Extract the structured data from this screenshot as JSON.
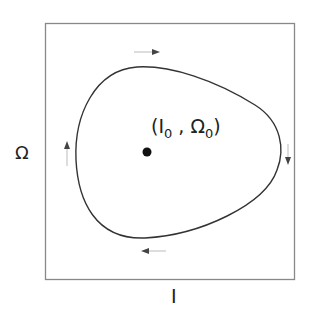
{
  "diagram": {
    "type": "phase-portrait",
    "x_axis_label": "I",
    "y_axis_label": "Ω",
    "fixed_point": {
      "label_open": "(",
      "var1": "I",
      "sub1": "0",
      "sep": " , ",
      "var2": "Ω",
      "sub2": "0",
      "label_close": ")"
    },
    "orbit_direction": "clockwise",
    "arrows": [
      "right (top)",
      "down (right)",
      "left (bottom)",
      "up (left)"
    ],
    "colors": {
      "curve": "#333333",
      "frame": "#888888",
      "arrow": "#aaaaaa"
    }
  }
}
